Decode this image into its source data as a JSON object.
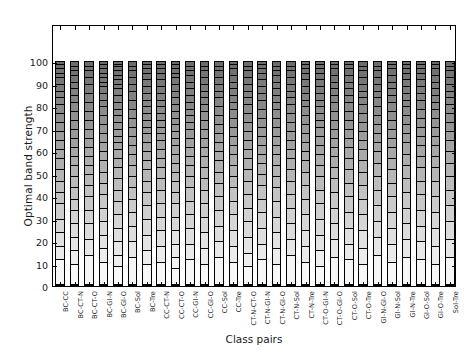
{
  "chart_data": {
    "type": "bar",
    "stacked": true,
    "title": "",
    "xlabel": "Class pairs",
    "ylabel": "Optimal band strength",
    "ylim": [
      0,
      100
    ],
    "yticks": [
      0,
      10,
      20,
      30,
      40,
      50,
      60,
      70,
      80,
      90,
      100
    ],
    "grid": false,
    "legend": "none",
    "colormap": "grayscale, dark at top (high values) to white at bottom (low values)",
    "categories": [
      "BC-CC",
      "BC-CT-N",
      "BC-CT-O",
      "BC-Gl-N",
      "BC-Gl-O",
      "BC-Sol",
      "BC-Tre",
      "CC-CT-N",
      "CC-CT-O",
      "CC-Gl-N",
      "CC-Gl-O",
      "CC-Sol",
      "CC-Tre",
      "CT-N-CT-O",
      "CT-N-Gl-N",
      "CT-N-Gl-O",
      "CT-N-Sol",
      "CT-N-Tre",
      "CT-O-Gl-N",
      "CT-O-Gl-O",
      "CT-O-Sol",
      "CT-O-Tre",
      "Gl-N-Gl-O",
      "Gl-N-Sol",
      "Gl-N-Tre",
      "Gl-O-Sol",
      "Gl-O-Tre",
      "Sol-Tre"
    ],
    "values": [
      100,
      100,
      100,
      100,
      100,
      100,
      100,
      100,
      100,
      100,
      100,
      100,
      100,
      100,
      100,
      100,
      100,
      100,
      100,
      100,
      100,
      100,
      100,
      100,
      100,
      100,
      100,
      100
    ],
    "segment_boundaries": [
      [
        0,
        11,
        17,
        23,
        29,
        36,
        41,
        46,
        51,
        56,
        60,
        64,
        68,
        72,
        76,
        80,
        83,
        86,
        89,
        92,
        94,
        96,
        98,
        100
      ],
      [
        0,
        9,
        15,
        21,
        27,
        33,
        38,
        43,
        48,
        53,
        57,
        61,
        65,
        69,
        73,
        77,
        81,
        84,
        87,
        90,
        93,
        95,
        97,
        99,
        100
      ],
      [
        0,
        13,
        20,
        27,
        33,
        39,
        44,
        49,
        53,
        57,
        61,
        65,
        69,
        73,
        77,
        81,
        85,
        89,
        92,
        95,
        97,
        99,
        100
      ],
      [
        0,
        10,
        16,
        22,
        28,
        34,
        40,
        45,
        50,
        55,
        59,
        63,
        67,
        71,
        75,
        79,
        82,
        85,
        88,
        90,
        92,
        94,
        96,
        98,
        100
      ],
      [
        0,
        8,
        13,
        19,
        25,
        31,
        37,
        42,
        47,
        52,
        56,
        60,
        63,
        66,
        69,
        72,
        75,
        78,
        81,
        84,
        87,
        89,
        91,
        93,
        95,
        97,
        98,
        100
      ],
      [
        0,
        12,
        19,
        26,
        32,
        38,
        43,
        48,
        53,
        58,
        62,
        66,
        70,
        74,
        78,
        82,
        86,
        89,
        92,
        95,
        97,
        99,
        100
      ],
      [
        0,
        9,
        15,
        22,
        29,
        35,
        41,
        46,
        51,
        55,
        59,
        63,
        67,
        70,
        73,
        76,
        79,
        82,
        85,
        88,
        91,
        94,
        96,
        98,
        100
      ],
      [
        0,
        10,
        17,
        24,
        30,
        36,
        42,
        47,
        52,
        56,
        60,
        64,
        67,
        70,
        73,
        76,
        79,
        82,
        85,
        88,
        91,
        94,
        96,
        98,
        100
      ],
      [
        0,
        7,
        12,
        18,
        24,
        30,
        36,
        41,
        46,
        50,
        54,
        58,
        62,
        65,
        68,
        71,
        74,
        77,
        80,
        83,
        86,
        89,
        92,
        94,
        96,
        98,
        100
      ],
      [
        0,
        11,
        18,
        25,
        31,
        37,
        43,
        48,
        53,
        57,
        61,
        65,
        69,
        72,
        75,
        78,
        81,
        84,
        87,
        90,
        93,
        95,
        97,
        99,
        100
      ],
      [
        0,
        9,
        16,
        23,
        30,
        36,
        42,
        47,
        52,
        57,
        61,
        65,
        69,
        73,
        77,
        80,
        83,
        86,
        89,
        92,
        95,
        97,
        99,
        100
      ],
      [
        0,
        12,
        19,
        26,
        33,
        39,
        45,
        50,
        55,
        59,
        63,
        67,
        71,
        75,
        79,
        83,
        86,
        89,
        92,
        95,
        97,
        99,
        100
      ],
      [
        0,
        10,
        17,
        24,
        31,
        37,
        43,
        48,
        53,
        58,
        62,
        66,
        70,
        74,
        78,
        81,
        84,
        87,
        90,
        93,
        96,
        98,
        100
      ],
      [
        0,
        8,
        14,
        21,
        28,
        34,
        40,
        46,
        51,
        56,
        60,
        64,
        68,
        72,
        76,
        80,
        83,
        86,
        89,
        92,
        95,
        97,
        99,
        100
      ],
      [
        0,
        11,
        18,
        25,
        32,
        38,
        44,
        49,
        54,
        58,
        62,
        66,
        70,
        74,
        78,
        82,
        85,
        88,
        91,
        94,
        96,
        98,
        100
      ],
      [
        0,
        9,
        16,
        23,
        30,
        37,
        43,
        48,
        53,
        58,
        62,
        66,
        70,
        74,
        78,
        81,
        84,
        87,
        90,
        93,
        95,
        97,
        99,
        100
      ],
      [
        0,
        13,
        20,
        27,
        34,
        40,
        46,
        51,
        56,
        60,
        64,
        68,
        72,
        76,
        80,
        83,
        86,
        89,
        92,
        95,
        97,
        99,
        100
      ],
      [
        0,
        10,
        17,
        24,
        31,
        38,
        44,
        50,
        55,
        59,
        63,
        67,
        71,
        75,
        79,
        82,
        85,
        88,
        91,
        94,
        96,
        98,
        100
      ],
      [
        0,
        8,
        15,
        22,
        29,
        36,
        42,
        48,
        53,
        58,
        62,
        66,
        70,
        73,
        76,
        79,
        82,
        85,
        88,
        91,
        94,
        96,
        98,
        100
      ],
      [
        0,
        12,
        20,
        27,
        34,
        41,
        47,
        52,
        57,
        61,
        65,
        69,
        73,
        77,
        81,
        84,
        87,
        90,
        93,
        96,
        98,
        100
      ],
      [
        0,
        11,
        18,
        25,
        32,
        39,
        45,
        51,
        56,
        61,
        65,
        69,
        73,
        77,
        81,
        84,
        87,
        90,
        93,
        96,
        98,
        100
      ],
      [
        0,
        9,
        16,
        24,
        31,
        38,
        44,
        50,
        55,
        60,
        64,
        68,
        72,
        76,
        80,
        83,
        86,
        89,
        92,
        95,
        97,
        99,
        100
      ],
      [
        0,
        13,
        21,
        28,
        35,
        42,
        48,
        54,
        59,
        63,
        67,
        71,
        75,
        79,
        83,
        86,
        89,
        92,
        95,
        97,
        99,
        100
      ],
      [
        0,
        10,
        18,
        25,
        32,
        39,
        45,
        51,
        56,
        61,
        65,
        69,
        73,
        77,
        81,
        84,
        87,
        90,
        93,
        96,
        98,
        100
      ],
      [
        0,
        12,
        20,
        27,
        34,
        41,
        47,
        53,
        58,
        63,
        67,
        71,
        75,
        79,
        82,
        85,
        88,
        91,
        94,
        96,
        98,
        100
      ],
      [
        0,
        11,
        19,
        26,
        33,
        40,
        46,
        52,
        57,
        62,
        66,
        70,
        74,
        78,
        82,
        85,
        88,
        91,
        94,
        96,
        98,
        100
      ],
      [
        0,
        9,
        17,
        25,
        32,
        39,
        46,
        52,
        57,
        62,
        66,
        70,
        74,
        78,
        81,
        84,
        87,
        90,
        93,
        96,
        98,
        100
      ],
      [
        0,
        12,
        20,
        28,
        35,
        42,
        48,
        54,
        59,
        64,
        68,
        72,
        76,
        80,
        83,
        86,
        89,
        92,
        95,
        97,
        99,
        100
      ]
    ]
  },
  "axes": {
    "ylabel": "Optimal band strength",
    "xlabel": "Class pairs",
    "ytick_labels": [
      "0",
      "10",
      "20",
      "30",
      "40",
      "50",
      "60",
      "70",
      "80",
      "90",
      "100"
    ],
    "xtick_labels": [
      "BC-CC",
      "BC-CT-N",
      "BC-CT-O",
      "BC-Gl-N",
      "BC-Gl-O",
      "BC-Sol",
      "BC-Tre",
      "CC-CT-N",
      "CC-CT-O",
      "CC-Gl-N",
      "CC-Gl-O",
      "CC-Sol",
      "CC-Tre",
      "CT-N-CT-O",
      "CT-N-Gl-N",
      "CT-N-Gl-O",
      "CT-N-Sol",
      "CT-N-Tre",
      "CT-O-Gl-N",
      "CT-O-Gl-O",
      "CT-O-Sol",
      "CT-O-Tre",
      "Gl-N-Gl-O",
      "Gl-N-Sol",
      "Gl-N-Tre",
      "Gl-O-Sol",
      "Gl-O-Tre",
      "Sol-Tre"
    ]
  },
  "colors": {
    "axis": "#000000",
    "text": "#1a1a1a",
    "background": "#ffffff",
    "segment_dark": "#6e6e6e",
    "segment_light": "#ffffff"
  }
}
